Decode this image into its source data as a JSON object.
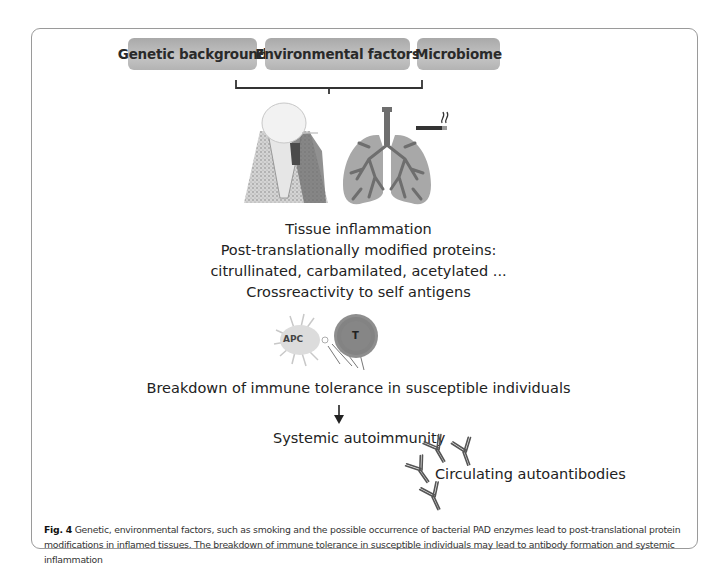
{
  "figure": {
    "factors": [
      {
        "label": "Genetic background"
      },
      {
        "label": "Environmental factors"
      },
      {
        "label": "Microbiome"
      }
    ],
    "illustrations": {
      "tooth": "periodontitis-tooth-icon",
      "lungs": "lungs-icon",
      "cigarette": "cigarette-icon"
    },
    "tissue_block": {
      "line1": "Tissue inflammation",
      "line2": "Post-translationally modified proteins:",
      "line3": "citrullinated, carbamilated, acetylated  ...",
      "line4": "Crossreactivity to self antigens"
    },
    "cells": {
      "apc_label": "APC",
      "tcell_label": "T"
    },
    "breakdown": "Breakdown of immune tolerance in susceptible individuals",
    "arrow": "down-arrow-icon",
    "systemic": "Systemic autoimmunity",
    "circulating": "Circulating autoantibodies",
    "colors": {
      "box_fill": "#b8b8b8",
      "tcell_fill": "#8a8a8a",
      "lung_fill": "#a8a8a8",
      "airway_fill": "#6e6e6e"
    }
  },
  "caption": {
    "label": "Fig. 4",
    "text": " Genetic, environmental factors, such as smoking and the possible occurrence of bacterial PAD enzymes lead to post-translational protein modifications in inflamed tissues. The breakdown of immune tolerance in susceptible individuals may lead to antibody formation and systemic inflammation"
  }
}
